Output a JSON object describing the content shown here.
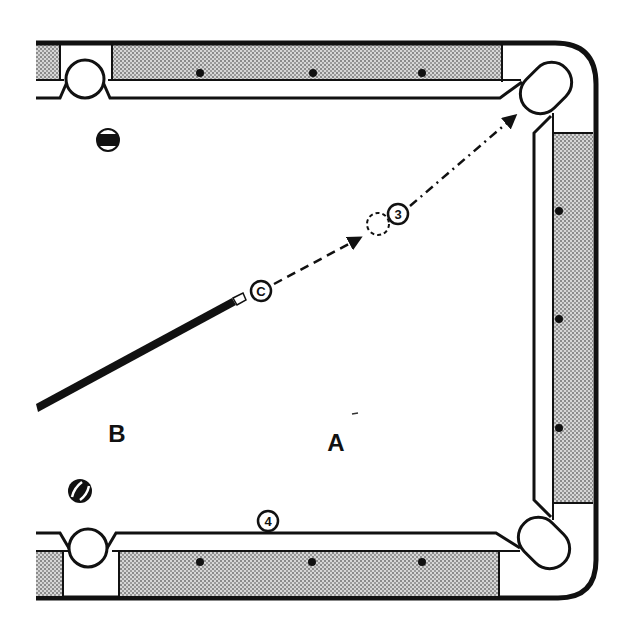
{
  "diagram": {
    "background": "#ffffff",
    "ink_color": "#111111",
    "cloth_pattern": "stippled-gray",
    "labels": {
      "zone_a": "A",
      "zone_b": "B"
    },
    "balls": {
      "cue_ball": {
        "label": "C",
        "x": 261,
        "y": 291
      },
      "object_ball_3": {
        "label": "3",
        "x": 398,
        "y": 214
      },
      "ghost_ball": {
        "label": "",
        "x": 378,
        "y": 222
      },
      "object_ball_4": {
        "label": "4",
        "x": 268,
        "y": 521
      },
      "striped_ball_top": {
        "label": "",
        "x": 108,
        "y": 140
      },
      "striped_ball_bottom": {
        "label": "",
        "x": 80,
        "y": 491
      }
    },
    "pockets": [
      {
        "name": "top-side-pocket",
        "x": 85,
        "y": 73
      },
      {
        "name": "top-right-corner-pocket",
        "x": 547,
        "y": 88
      },
      {
        "name": "bottom-side-pocket",
        "x": 87,
        "y": 548
      },
      {
        "name": "bottom-right-corner-pocket",
        "x": 545,
        "y": 543
      }
    ],
    "diamonds": {
      "top_rail": [
        200,
        313,
        422
      ],
      "right_rail": [
        211,
        319,
        428
      ],
      "bottom_rail": [
        200,
        312,
        422
      ]
    },
    "cue_stick": {
      "from": [
        36,
        408
      ],
      "to": [
        244,
        300
      ]
    },
    "shot_path": {
      "cue_to_ghost": "dashed",
      "ball_3_to_pocket": "dash-dot"
    }
  }
}
